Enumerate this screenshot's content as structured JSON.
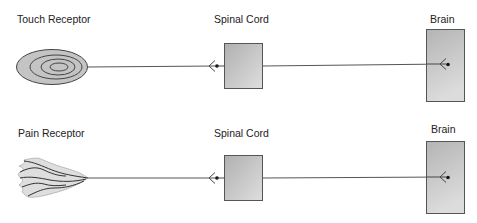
{
  "diagram": {
    "title": "",
    "colors": {
      "line": "#444444",
      "box_fill_light": "#dcdcdc",
      "box_fill_dark": "#b4b4b4",
      "box_stroke": "#555555",
      "receptor_fill": "#c8c8c8",
      "pain_fill": "#dedede",
      "text": "#222222"
    },
    "pathways": [
      {
        "receptor": {
          "label": "Touch Receptor",
          "type": "touch",
          "icon": "concentric-ellipses-icon"
        },
        "relay": {
          "label": "Spinal Cord"
        },
        "target": {
          "label": "Brain"
        }
      },
      {
        "receptor": {
          "label": "Pain Receptor",
          "type": "pain",
          "icon": "free-nerve-ending-icon"
        },
        "relay": {
          "label": "Spinal Cord"
        },
        "target": {
          "label": "Brain"
        }
      }
    ]
  }
}
